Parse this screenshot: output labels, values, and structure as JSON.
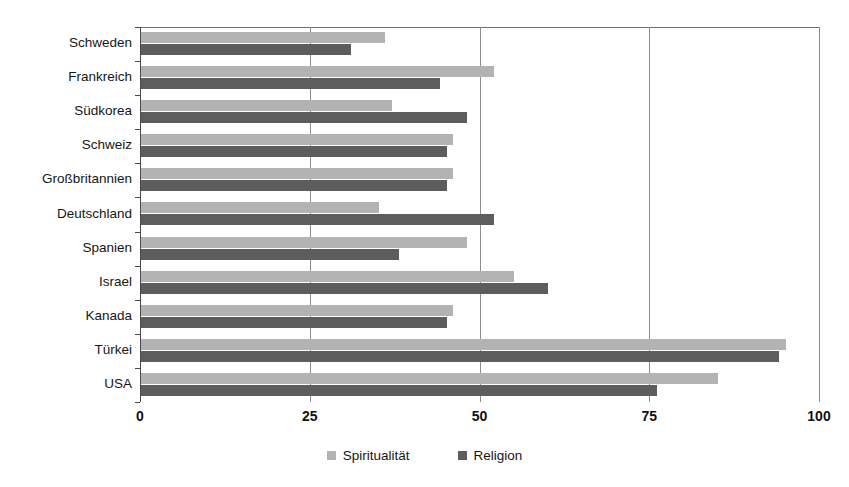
{
  "chart_data": {
    "type": "bar",
    "orientation": "horizontal",
    "title": "",
    "xlabel": "",
    "ylabel": "",
    "xlim": [
      0,
      100
    ],
    "grid": true,
    "gridlines": [
      0,
      25,
      50,
      75,
      100
    ],
    "tick_labels": [
      "0",
      "25",
      "50",
      "75",
      "100"
    ],
    "legend_position": "bottom",
    "categories": [
      "Schweden",
      "Frankreich",
      "Südkorea",
      "Schweiz",
      "Großbritannien",
      "Deutschland",
      "Spanien",
      "Israel",
      "Kanada",
      "Türkei",
      "USA"
    ],
    "series": [
      {
        "name": "Spiritualität",
        "color": "#b3b3b3",
        "values": [
          36,
          52,
          37,
          46,
          46,
          35,
          48,
          55,
          46,
          95,
          85
        ]
      },
      {
        "name": "Religion",
        "color": "#5d5d5d",
        "values": [
          31,
          44,
          48,
          45,
          45,
          52,
          38,
          60,
          45,
          94,
          76
        ]
      }
    ]
  },
  "legend": {
    "items": [
      {
        "label": "Spiritualität",
        "color": "#b3b3b3"
      },
      {
        "label": "Religion",
        "color": "#5d5d5d"
      }
    ]
  },
  "title_remnant": ""
}
